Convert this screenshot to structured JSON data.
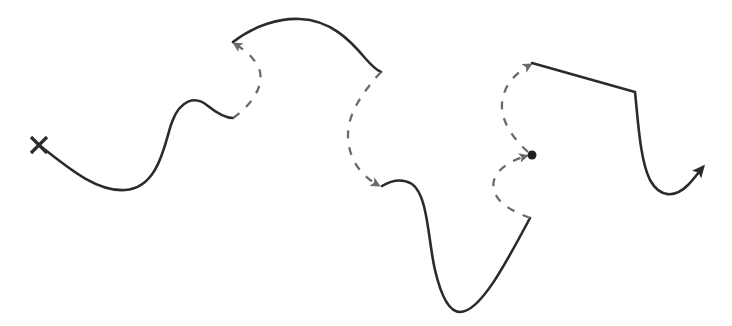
{
  "diagram": {
    "title": "",
    "width": 732,
    "height": 326,
    "colors": {
      "solid_stroke": "#2b2b2b",
      "dashed_stroke": "#6a6a6a",
      "background": "#ffffff"
    },
    "start_marker": {
      "type": "x-mark",
      "x": 39,
      "y": 145
    },
    "waypoint_marker": {
      "type": "dot",
      "x": 532,
      "y": 155
    },
    "segments": [
      {
        "id": "solid-1",
        "style": "solid",
        "from": [
          39,
          145
        ],
        "to": [
          233,
          118
        ]
      },
      {
        "id": "dashed-1",
        "style": "dashed",
        "from": [
          233,
          118
        ],
        "to": [
          233,
          42
        ],
        "arrow_end": true
      },
      {
        "id": "solid-2",
        "style": "solid",
        "from": [
          233,
          42
        ],
        "to": [
          381,
          72
        ]
      },
      {
        "id": "dashed-2",
        "style": "dashed",
        "from": [
          381,
          72
        ],
        "to": [
          382,
          186
        ],
        "arrow_end": true
      },
      {
        "id": "solid-3",
        "style": "solid",
        "from": [
          382,
          186
        ],
        "to": [
          530,
          218
        ]
      },
      {
        "id": "dashed-3",
        "style": "dashed",
        "from": [
          530,
          218
        ],
        "to": [
          530,
          156
        ],
        "arrow_end": true
      },
      {
        "id": "dashed-4",
        "style": "dashed",
        "from": [
          532,
          155
        ],
        "to": [
          532,
          63
        ],
        "arrow_end": true
      },
      {
        "id": "solid-4",
        "style": "solid",
        "from": [
          532,
          63
        ],
        "to": [
          703,
          167
        ],
        "arrow_end": true
      }
    ],
    "end_marker": {
      "type": "arrow",
      "x": 703,
      "y": 167
    }
  }
}
